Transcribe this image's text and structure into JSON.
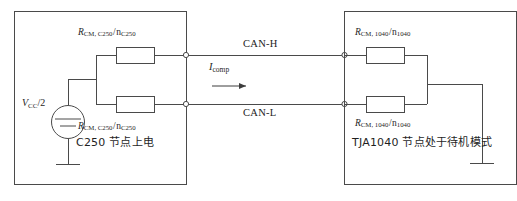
{
  "figure": {
    "type": "circuit-schematic"
  },
  "left_block": {
    "caption": "C250 节点上电",
    "source": {
      "label_main": "V",
      "label_sub": "CC",
      "label_tail": "/2",
      "symbol": "dc-voltage-source"
    },
    "resistor_top": {
      "symbol": "R",
      "subscript": "CM, C250",
      "separator": "/",
      "denominator": "n",
      "denominator_subscript": "C250"
    },
    "resistor_bottom": {
      "symbol": "R",
      "subscript": "CM, C250",
      "separator": "/",
      "denominator": "n",
      "denominator_subscript": "C250"
    },
    "ground": "ground-symbol"
  },
  "right_block": {
    "caption": "TJA1040 节点处于待机模式",
    "resistor_top": {
      "symbol": "R",
      "subscript": "CM, 1040",
      "separator": "/",
      "denominator": "n",
      "denominator_subscript": "1040"
    },
    "resistor_bottom": {
      "symbol": "R",
      "subscript": "CM, 1040",
      "separator": "/",
      "denominator": "n",
      "denominator_subscript": "1040"
    },
    "ground": "ground-symbol"
  },
  "bus": {
    "upper_label": "CAN-H",
    "lower_label": "CAN-L"
  },
  "current": {
    "symbol": "I",
    "subscript": "comp",
    "direction": "right"
  },
  "colors": {
    "line": "#4a4a4a",
    "text": "#262626",
    "background": "#ffffff"
  }
}
